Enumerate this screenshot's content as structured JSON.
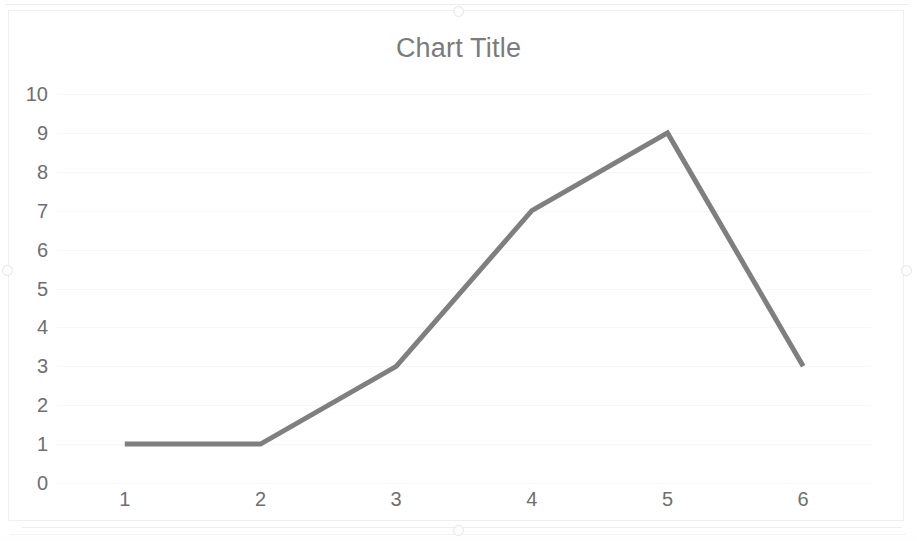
{
  "chart_data": {
    "type": "line",
    "title": "Chart Title",
    "xlabel": "",
    "ylabel": "",
    "categories": [
      "1",
      "2",
      "3",
      "4",
      "5",
      "6"
    ],
    "values": [
      1,
      1,
      3,
      7,
      9,
      3
    ],
    "series": [
      {
        "name": "Series 1",
        "values": [
          1,
          1,
          3,
          7,
          9,
          3
        ]
      }
    ],
    "ylim": [
      0,
      10
    ],
    "y_ticks": [
      "0",
      "1",
      "2",
      "3",
      "4",
      "5",
      "6",
      "7",
      "8",
      "9",
      "10"
    ],
    "x_ticks": [
      "1",
      "2",
      "3",
      "4",
      "5",
      "6"
    ],
    "grid": true,
    "legend": false,
    "legend_position": "none",
    "line_color": "#7f7f7f",
    "line_width": 5,
    "markers": false,
    "title_color": "#7b7b7b",
    "tick_label_color": "#6f6f6f",
    "gridline_color": "#f7f7f8",
    "plot_background": "#ffffff"
  },
  "object": {
    "name": "chart-object",
    "selected": true,
    "handles": [
      {
        "name": "handle-top-center"
      },
      {
        "name": "handle-bottom-center"
      },
      {
        "name": "handle-middle-left"
      },
      {
        "name": "handle-middle-right"
      }
    ]
  }
}
